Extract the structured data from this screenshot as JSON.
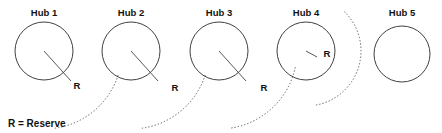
{
  "figure": {
    "title": "",
    "background_color": "#ffffff",
    "line_color": "#2b2b2b",
    "dashed_color": "#555555",
    "text_color": "#111111"
  },
  "hubs": [
    {
      "id": "hub-1",
      "label": "Hub 1",
      "cx": 44,
      "cy": 51,
      "r": 29,
      "label_x": 44,
      "label_y": 16
    },
    {
      "id": "hub-2",
      "label": "Hub 2",
      "cx": 131,
      "cy": 51,
      "r": 29,
      "label_x": 131,
      "label_y": 16
    },
    {
      "id": "hub-3",
      "label": "Hub 3",
      "cx": 219,
      "cy": 51,
      "r": 29,
      "label_x": 219,
      "label_y": 16
    },
    {
      "id": "hub-4",
      "label": "Hub 4",
      "cx": 306,
      "cy": 51,
      "r": 29,
      "label_x": 306,
      "label_y": 16
    },
    {
      "id": "hub-5",
      "label": "Hub 5",
      "cx": 402,
      "cy": 54,
      "r": 28,
      "label_x": 402,
      "label_y": 16
    }
  ],
  "reserve_arcs": [
    {
      "id": "reserve-arc-1",
      "cx": 44,
      "cy": 51,
      "r": 78,
      "from_deg": 18,
      "to_deg": 82
    },
    {
      "id": "reserve-arc-2",
      "cx": 131,
      "cy": 51,
      "r": 78,
      "from_deg": 18,
      "to_deg": 82
    },
    {
      "id": "reserve-arc-3",
      "cx": 219,
      "cy": 51,
      "r": 78,
      "from_deg": 12,
      "to_deg": 82
    },
    {
      "id": "reserve-arc-4",
      "cx": 306,
      "cy": 51,
      "r": 55,
      "from_deg": -46,
      "to_deg": 80
    }
  ],
  "radius_indicators": [
    {
      "id": "radius-line-1",
      "x1": 44,
      "y1": 51,
      "x2": 71,
      "y2": 81
    },
    {
      "id": "radius-line-2",
      "x1": 131,
      "y1": 51,
      "x2": 158,
      "y2": 81
    },
    {
      "id": "radius-line-3",
      "x1": 219,
      "y1": 51,
      "x2": 246,
      "y2": 81
    },
    {
      "id": "radius-line-4",
      "x1": 306,
      "y1": 51,
      "x2": 317,
      "y2": 57
    }
  ],
  "r_markers": [
    {
      "id": "r-marker-1",
      "text": "R",
      "x": 77,
      "y": 89
    },
    {
      "id": "r-marker-2",
      "text": "R",
      "x": 175,
      "y": 91
    },
    {
      "id": "r-marker-3",
      "text": "R",
      "x": 264,
      "y": 91
    },
    {
      "id": "r-marker-4",
      "text": "R",
      "x": 327,
      "y": 57
    }
  ],
  "legend": {
    "text": "R = Reserve",
    "x": 8,
    "y": 127
  }
}
